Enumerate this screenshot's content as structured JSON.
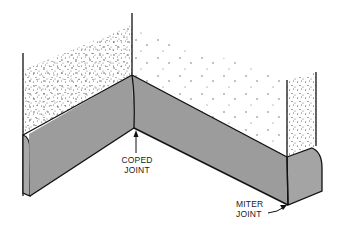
{
  "diagram": {
    "type": "baseboard-joint-illustration",
    "labels": {
      "coped_line1": "COPED",
      "coped_line2": "JOINT",
      "miter_line1": "MITER",
      "miter_line2": "JOINT"
    },
    "colors": {
      "baseboard_face": "#9c9c9c",
      "baseboard_side": "#a8a8a8",
      "outline": "#111111",
      "wall_speckle": "#444444",
      "background": "#ffffff"
    }
  }
}
